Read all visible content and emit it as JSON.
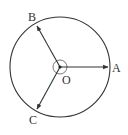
{
  "diagram": {
    "type": "circle-vectors",
    "center": {
      "label": "O",
      "x": 60,
      "y": 67
    },
    "radius": 50,
    "stroke_color": "#333333",
    "points": [
      {
        "label": "A",
        "x": 110,
        "y": 67
      },
      {
        "label": "B",
        "x": 36,
        "y": 24
      },
      {
        "label": "C",
        "x": 36,
        "y": 111
      }
    ],
    "angle_marker": {
      "radius": 7
    }
  }
}
